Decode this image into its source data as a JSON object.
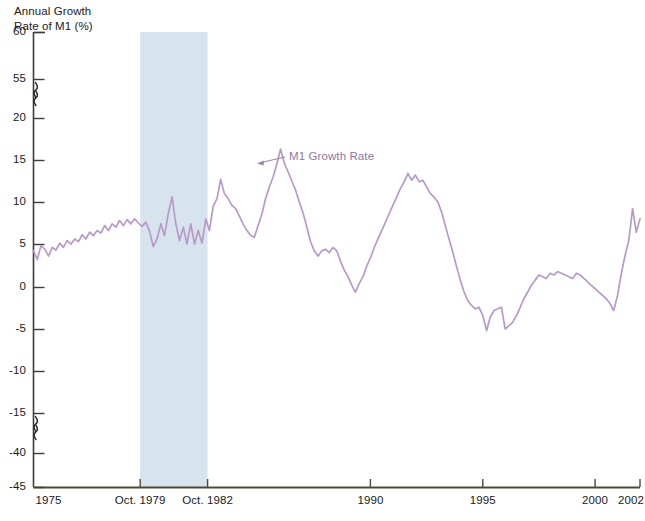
{
  "chart_data": {
    "type": "line",
    "title": "",
    "ylabel": "Annual Growth\nRate of M1 (%)",
    "xlabel": "",
    "grid": false,
    "legend_position": "inline-annotation",
    "axis_breaks": {
      "y": [
        [
          55,
          20
        ],
        [
          -15,
          -40
        ]
      ],
      "symbol": "squiggle"
    },
    "ylim": [
      -45,
      60
    ],
    "y_ticks": [
      "60",
      "55",
      "20",
      "15",
      "10",
      "5",
      "0",
      "-5",
      "-10",
      "-15",
      "-40",
      "-45"
    ],
    "x_ticks": [
      "1975",
      "Oct. 1979",
      "Oct. 1982",
      "1990",
      "1995",
      "2000",
      "2002"
    ],
    "x_tick_years": [
      1975,
      1979.75,
      1982.75,
      1990,
      1995,
      2000,
      2002
    ],
    "xlim": [
      1975,
      2002
    ],
    "shaded_region": {
      "label": "",
      "start": "Oct. 1979",
      "end": "Oct. 1982",
      "color": "#d7e3ed"
    },
    "series": [
      {
        "name": "M1 Growth Rate",
        "color": "#b79ac9",
        "annotation": "M1 Growth Rate",
        "x": [
          1975.0,
          1975.17,
          1975.33,
          1975.5,
          1975.67,
          1975.83,
          1976.0,
          1976.17,
          1976.33,
          1976.5,
          1976.67,
          1976.83,
          1977.0,
          1977.17,
          1977.33,
          1977.5,
          1977.67,
          1977.83,
          1978.0,
          1978.17,
          1978.33,
          1978.5,
          1978.67,
          1978.83,
          1979.0,
          1979.17,
          1979.33,
          1979.5,
          1979.67,
          1979.83,
          1980.0,
          1980.17,
          1980.33,
          1980.5,
          1980.67,
          1980.83,
          1981.0,
          1981.17,
          1981.33,
          1981.5,
          1981.67,
          1981.83,
          1982.0,
          1982.17,
          1982.33,
          1982.5,
          1982.67,
          1982.83,
          1983.0,
          1983.17,
          1983.33,
          1983.5,
          1983.67,
          1983.83,
          1984.0,
          1984.17,
          1984.33,
          1984.5,
          1984.67,
          1984.83,
          1985.0,
          1985.17,
          1985.33,
          1985.5,
          1985.67,
          1985.83,
          1986.0,
          1986.17,
          1986.33,
          1986.5,
          1986.67,
          1986.83,
          1987.0,
          1987.17,
          1987.33,
          1987.5,
          1987.67,
          1987.83,
          1988.0,
          1988.17,
          1988.33,
          1988.5,
          1988.67,
          1988.83,
          1989.0,
          1989.17,
          1989.33,
          1989.5,
          1989.67,
          1989.83,
          1990.0,
          1990.17,
          1990.33,
          1990.5,
          1990.67,
          1990.83,
          1991.0,
          1991.17,
          1991.33,
          1991.5,
          1991.67,
          1991.83,
          1992.0,
          1992.17,
          1992.33,
          1992.5,
          1992.67,
          1992.83,
          1993.0,
          1993.17,
          1993.33,
          1993.5,
          1993.67,
          1993.83,
          1994.0,
          1994.17,
          1994.33,
          1994.5,
          1994.67,
          1994.83,
          1995.0,
          1995.17,
          1995.33,
          1995.5,
          1995.67,
          1995.83,
          1996.0,
          1996.17,
          1996.33,
          1996.5,
          1996.67,
          1996.83,
          1997.0,
          1997.17,
          1997.33,
          1997.5,
          1997.67,
          1997.83,
          1998.0,
          1998.17,
          1998.33,
          1998.5,
          1998.67,
          1998.83,
          1999.0,
          1999.17,
          1999.33,
          1999.5,
          1999.67,
          1999.83,
          2000.0,
          2000.17,
          2000.33,
          2000.5,
          2000.67,
          2000.83,
          2001.0,
          2001.17,
          2001.33,
          2001.5,
          2001.67,
          2001.83,
          2002.0
        ],
        "values": [
          4.2,
          3.2,
          4.8,
          4.4,
          3.6,
          4.6,
          4.3,
          5.1,
          4.6,
          5.4,
          5.0,
          5.6,
          5.3,
          6.1,
          5.6,
          6.4,
          6.0,
          6.6,
          6.3,
          7.2,
          6.6,
          7.4,
          7.0,
          7.8,
          7.2,
          7.9,
          7.4,
          8.0,
          7.5,
          7.1,
          7.6,
          6.5,
          4.7,
          5.6,
          7.4,
          6.0,
          8.6,
          10.6,
          7.5,
          5.4,
          7.0,
          5.0,
          7.4,
          5.0,
          6.6,
          5.1,
          8.0,
          6.6,
          9.5,
          10.4,
          12.7,
          11.0,
          10.4,
          9.6,
          9.2,
          8.3,
          7.4,
          6.6,
          6.0,
          5.8,
          7.2,
          8.6,
          10.4,
          11.8,
          13.0,
          14.5,
          16.3,
          14.6,
          13.6,
          12.5,
          11.4,
          10.0,
          8.7,
          7.0,
          5.3,
          4.2,
          3.6,
          4.2,
          4.4,
          4.0,
          4.6,
          4.2,
          3.0,
          2.0,
          1.2,
          0.2,
          -0.6,
          0.4,
          1.2,
          2.4,
          3.4,
          4.6,
          5.6,
          6.6,
          7.6,
          8.6,
          9.6,
          10.6,
          11.6,
          12.4,
          13.4,
          12.6,
          13.2,
          12.4,
          12.6,
          11.8,
          11.0,
          10.6,
          10.0,
          8.8,
          7.2,
          5.6,
          4.0,
          2.4,
          0.8,
          -0.6,
          -1.6,
          -2.2,
          -2.6,
          -2.4,
          -3.4,
          -5.2,
          -3.6,
          -2.8,
          -2.6,
          -2.4,
          -5.0,
          -4.6,
          -4.2,
          -3.4,
          -2.4,
          -1.4,
          -0.6,
          0.2,
          0.8,
          1.4,
          1.2,
          1.0,
          1.6,
          1.4,
          1.8,
          1.6,
          1.4,
          1.2,
          1.0,
          1.6,
          1.4,
          1.0,
          0.6,
          0.2,
          -0.2,
          -0.6,
          -1.0,
          -1.4,
          -2.0,
          -2.8,
          -1.0,
          1.6,
          3.6,
          5.4,
          9.2,
          6.4,
          8.0
        ]
      }
    ]
  },
  "annotations": {
    "series_label": "M1 Growth Rate"
  },
  "colors": {
    "line": "#b79ac9",
    "shaded_band": "#d7e3ed",
    "axis": "#3c3c3c",
    "text": "#1a1a1a",
    "annotation_text": "#8d77a3",
    "background": "#ffffff"
  }
}
